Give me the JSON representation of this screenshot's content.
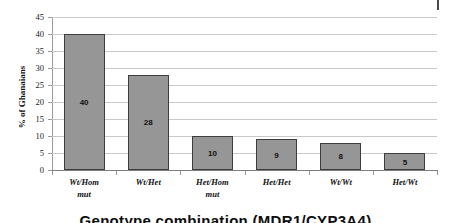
{
  "chart_data": {
    "type": "bar",
    "title": "",
    "xlabel": "Genotype combination (MDR1/CYP3A4)",
    "ylabel": "% of Ghanaians",
    "categories": [
      "Wt/Hom mut",
      "Wt/Het",
      "Het/Hom mut",
      "Het/Het",
      "Wt/Wt",
      "Het/Wt"
    ],
    "category_lines": [
      [
        "Wt/Hom",
        "mut"
      ],
      [
        "Wt/Het",
        ""
      ],
      [
        "Het/Hom",
        "mut"
      ],
      [
        "Het/Het",
        ""
      ],
      [
        "Wt/Wt",
        ""
      ],
      [
        "Het/Wt",
        ""
      ]
    ],
    "values": [
      40,
      28,
      10,
      9,
      8,
      5
    ],
    "value_labels": [
      "40",
      "28",
      "10",
      "9",
      "8",
      "5"
    ],
    "ylim": [
      0,
      45
    ],
    "ytick_values": [
      45,
      40,
      35,
      30,
      25,
      20,
      15,
      10,
      5,
      0
    ],
    "ytick_labels": [
      "45",
      "40",
      "35",
      "30",
      "25",
      "20",
      "15",
      "10",
      "5",
      "0"
    ],
    "grid": "horizontal",
    "legend": "none",
    "bar_fill_color": "#969696",
    "bar_border_color": "#3d3d3d",
    "gridline_color": "#c9c9c9",
    "axis_color": "#9a9a9a"
  },
  "artifacts": {
    "page_mark": "page-edge-mark"
  }
}
